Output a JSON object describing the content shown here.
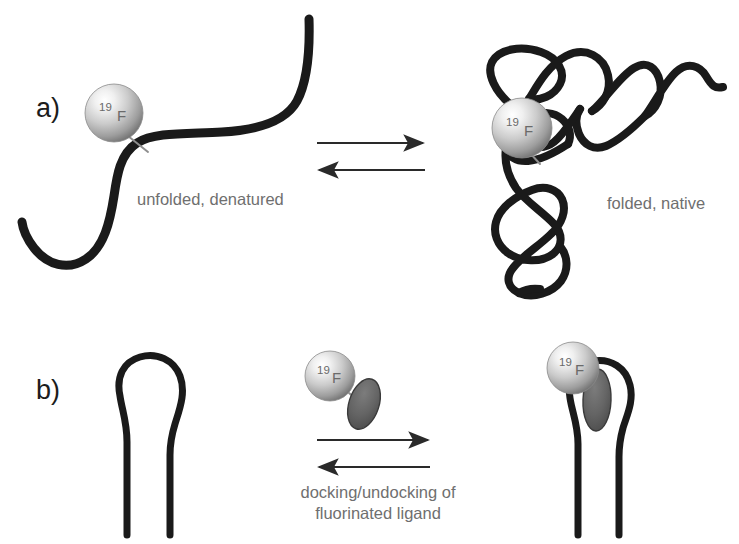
{
  "figure": {
    "width": 739,
    "height": 544,
    "background": "#ffffff"
  },
  "panels": [
    {
      "id": "a",
      "label": "a)",
      "label_x": 36,
      "label_y": 117,
      "left_state_label": "unfolded, denatured",
      "right_state_label": "folded, native",
      "left_state_label_x": 137,
      "left_state_label_y": 205,
      "right_state_label_x": 607,
      "right_state_label_y": 209,
      "arrows": {
        "forward_y": 143,
        "reverse_y": 170,
        "x_start": 317,
        "x_end": 425
      }
    },
    {
      "id": "b",
      "label": "b)",
      "label_x": 36,
      "label_y": 399,
      "caption_lines": [
        "docking/undocking of",
        "fluorinated ligand"
      ],
      "caption_x": 378,
      "caption_y_first": 498,
      "caption_line_height": 21,
      "arrows": {
        "forward_y": 440,
        "reverse_y": 467,
        "x_start": 317,
        "x_end": 430
      }
    }
  ],
  "labels": {
    "fluorine_tag_mass": "19",
    "fluorine_tag_element": "F"
  },
  "markers": [
    {
      "name": "fluorine-label-unfolded",
      "cx": 114,
      "cy": 113,
      "r": 29
    },
    {
      "name": "fluorine-label-folded",
      "cx": 522,
      "cy": 128,
      "r": 30
    },
    {
      "name": "fluorine-label-free-ligand",
      "cx": 330,
      "cy": 376,
      "r": 25
    },
    {
      "name": "fluorine-label-docked-ligand",
      "cx": 573,
      "cy": 368,
      "r": 26
    }
  ],
  "ligands": [
    {
      "name": "ligand-free",
      "cx": 364,
      "cy": 404,
      "rx": 15,
      "ry": 26,
      "rotate": 18
    },
    {
      "name": "ligand-docked",
      "cx": 597,
      "cy": 400,
      "rx": 14,
      "ry": 31,
      "rotate": 2
    }
  ],
  "colors": {
    "chain_stroke": "#1a1a1a",
    "label_text": "#1c1c1c",
    "state_text": "#6f6f6f",
    "arrow": "#2a2a2a",
    "sphere_highlight": "#fdfdfd",
    "sphere_mid": "#cfcfcf",
    "sphere_edge": "#767676",
    "ligand_fill": "#5d5d5d",
    "ligand_stroke": "#3a3a3a",
    "tether": "#8e8e8e"
  }
}
